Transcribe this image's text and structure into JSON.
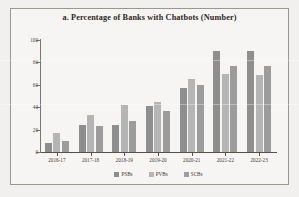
{
  "chart_data": {
    "type": "bar",
    "title": "a. Percentage of Banks with Chatbots (Number)",
    "xlabel": "",
    "ylabel": "Per cent",
    "categories": [
      "2016-17",
      "2017-18",
      "2018-19",
      "2019-20",
      "2020-21",
      "2021-22",
      "2022-23"
    ],
    "series": [
      {
        "name": "PSBs",
        "color": "#8e8e8e",
        "values": [
          8,
          24,
          24,
          41,
          57,
          90,
          90
        ]
      },
      {
        "name": "PVBs",
        "color": "#b5b5b5",
        "values": [
          17,
          33,
          42,
          45,
          65,
          70,
          69
        ]
      },
      {
        "name": "SCBs",
        "color": "#9c9c9c",
        "values": [
          10,
          23,
          28,
          37,
          60,
          77,
          77
        ]
      }
    ],
    "ylim": [
      0,
      100
    ],
    "yticks": [
      0,
      20,
      40,
      60,
      80,
      100
    ],
    "ytick_labels": [
      "0",
      "20",
      "40",
      "60",
      "80",
      "100"
    ],
    "grid": false,
    "legend_position": "bottom"
  },
  "figure": {
    "title": "a. Percentage of Banks with Chatbots (Number)",
    "y_axis_title": "Per cent"
  }
}
